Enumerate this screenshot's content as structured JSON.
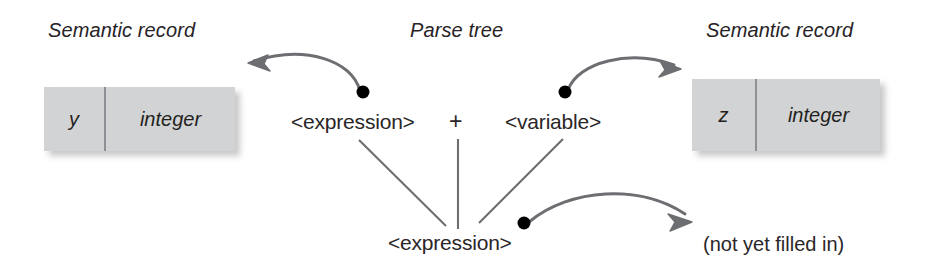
{
  "figure": {
    "type": "diagram"
  },
  "headings": {
    "left_record_title": "Semantic record",
    "parse_tree_title": "Parse tree",
    "right_record_title": "Semantic record"
  },
  "records": [
    {
      "id": "left-record",
      "name": "y",
      "type": "integer"
    },
    {
      "id": "right-record",
      "name": "z",
      "type": "integer"
    }
  ],
  "parse_tree": {
    "nodes": [
      {
        "id": "node-expression-left",
        "label": "<expression>"
      },
      {
        "id": "node-plus",
        "label": "+"
      },
      {
        "id": "node-variable",
        "label": "<variable>"
      },
      {
        "id": "node-expression-root",
        "label": "<expression>"
      }
    ]
  },
  "annotations": {
    "not_filled_in": "(not yet filled in)"
  },
  "colors": {
    "box_fill": "#d2d3d4",
    "box_divider": "#8d9094",
    "text": "#231f20",
    "connector": "#6d6e71",
    "tree_line": "#6d6e71",
    "dot": "#000000",
    "background": "#ffffff"
  }
}
